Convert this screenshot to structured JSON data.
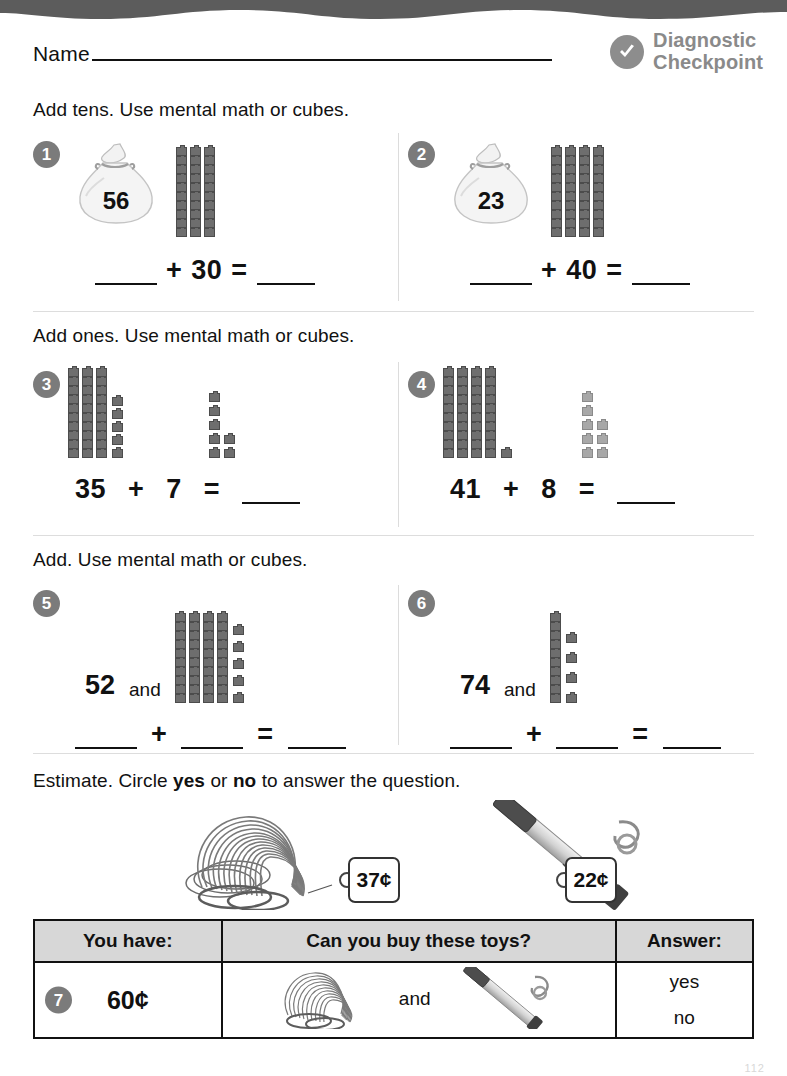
{
  "header": {
    "name_label": "Name",
    "badge_title_line1": "Diagnostic",
    "badge_title_line2": "Checkpoint",
    "badge_icon": "check-circle-icon",
    "badge_color": "#8a8a8a"
  },
  "sections": [
    {
      "instruction": "Add tens. Use mental math or cubes."
    },
    {
      "instruction": "Add ones. Use mental math or cubes."
    },
    {
      "instruction": "Add. Use mental math or cubes."
    },
    {
      "instruction_pre": "Estimate. Circle ",
      "instruction_yes": "yes",
      "instruction_mid": " or ",
      "instruction_no": "no",
      "instruction_post": " to answer the question."
    }
  ],
  "problems": [
    {
      "number": "1",
      "bag_value": "56",
      "rods": 3,
      "ones": 0,
      "equation": {
        "blank1": "",
        "op": "+",
        "value": "30",
        "eq": "=",
        "blank2": ""
      }
    },
    {
      "number": "2",
      "bag_value": "23",
      "rods": 4,
      "ones": 0,
      "equation": {
        "blank1": "",
        "op": "+",
        "value": "40",
        "eq": "=",
        "blank2": ""
      }
    },
    {
      "number": "3",
      "rods": 3,
      "ones": 5,
      "addend_ones": 7,
      "equation": {
        "left": "35",
        "op": "+",
        "right": "7",
        "eq": "=",
        "blank": ""
      }
    },
    {
      "number": "4",
      "rods": 4,
      "ones": 1,
      "addend_ones": 8,
      "equation": {
        "left": "41",
        "op": "+",
        "right": "8",
        "eq": "=",
        "blank": ""
      }
    },
    {
      "number": "5",
      "left_value": "52",
      "and_word": "and",
      "rods": 4,
      "ones": 5,
      "equation": {
        "blank1": "",
        "op": "+",
        "blank2": "",
        "eq": "=",
        "blank3": ""
      }
    },
    {
      "number": "6",
      "left_value": "74",
      "and_word": "and",
      "rods": 1,
      "ones": 4,
      "equation": {
        "blank1": "",
        "op": "+",
        "blank2": "",
        "eq": "=",
        "blank3": ""
      }
    }
  ],
  "estimate": {
    "toy1": {
      "name": "slinky-toy",
      "price": "37¢"
    },
    "toy2": {
      "name": "kazoo-toy",
      "price": "22¢"
    }
  },
  "table": {
    "headers": [
      "You have:",
      "Can you buy these toys?",
      "Answer:"
    ],
    "row": {
      "number": "7",
      "amount": "60¢",
      "and_word": "and",
      "answer_yes": "yes",
      "answer_no": "no"
    }
  },
  "footer": {
    "page_number": "112"
  }
}
